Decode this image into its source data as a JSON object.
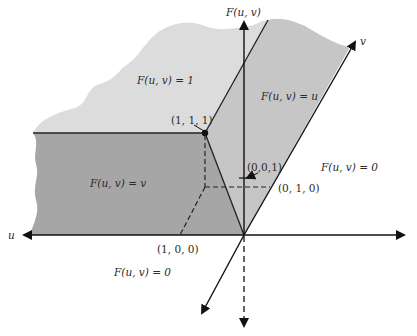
{
  "diagram": {
    "type": "3D surface plot of joint distribution function (copula) F(u, v)",
    "axes": {
      "vertical": "F(u, v)",
      "horizontal": "u",
      "oblique": "v"
    },
    "regions": {
      "top_left": "F(u, v) = 1",
      "top_right": "F(u, v) = u",
      "lower_left": "F(u, v) = v",
      "right_outside": "F(u, v) = 0",
      "bottom": "F(u, v) = 0"
    },
    "points": {
      "p111": "(1, 1, 1)",
      "p001": "(0,0,1)",
      "p010": "(0, 1, 0)",
      "p100": "(1, 0, 0)"
    },
    "colors": {
      "light_region": "#dcdcdc",
      "mid_region": "#c4c4c4",
      "dark_region": "#a4a4a4",
      "line": "#222222",
      "background": "#ffffff"
    }
  }
}
